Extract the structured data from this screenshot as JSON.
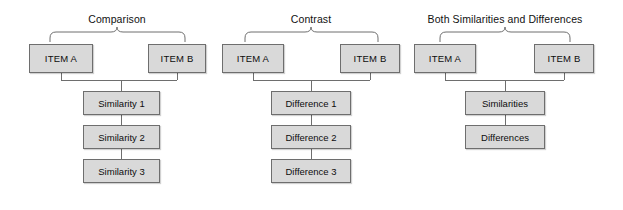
{
  "canvas": {
    "width": 623,
    "height": 210,
    "background": "#ffffff",
    "box_fill": "#d9d9d9",
    "box_border": "#6e6e6e",
    "line_color": "#6e6e6e",
    "text_color": "#111111"
  },
  "groups": [
    {
      "id": "comparison",
      "title": "Comparison",
      "title_x": 117,
      "title_y": 13,
      "brace": {
        "left": 50,
        "right": 185,
        "top": 27,
        "bottom": 42,
        "center": 117
      },
      "items": [
        {
          "label": "ITEM A",
          "x": 29,
          "y": 44,
          "w": 64,
          "h": 29
        },
        {
          "label": "ITEM B",
          "x": 148,
          "y": 44,
          "w": 58,
          "h": 29
        }
      ],
      "connector": {
        "left_x": 61,
        "right_x": 177,
        "from_y": 73,
        "bar_y": 80,
        "drop_x": 121,
        "to_y": 91
      },
      "details": [
        {
          "label": "Similarity 1",
          "x": 83,
          "y": 91,
          "w": 77,
          "h": 24
        },
        {
          "label": "Similarity 2",
          "x": 83,
          "y": 125,
          "w": 77,
          "h": 24
        },
        {
          "label": "Similarity 3",
          "x": 83,
          "y": 159,
          "w": 77,
          "h": 24
        }
      ],
      "detail_links": [
        {
          "x": 121,
          "y1": 115,
          "y2": 125
        },
        {
          "x": 121,
          "y1": 149,
          "y2": 159
        }
      ]
    },
    {
      "id": "contrast",
      "title": "Contrast",
      "title_x": 311,
      "title_y": 13,
      "brace": {
        "left": 245,
        "right": 378,
        "top": 27,
        "bottom": 42,
        "center": 311
      },
      "items": [
        {
          "label": "ITEM A",
          "x": 222,
          "y": 44,
          "w": 62,
          "h": 29
        },
        {
          "label": "ITEM B",
          "x": 340,
          "y": 44,
          "w": 60,
          "h": 29
        }
      ],
      "connector": {
        "left_x": 253,
        "right_x": 370,
        "from_y": 73,
        "bar_y": 80,
        "drop_x": 311,
        "to_y": 91
      },
      "details": [
        {
          "label": "Difference 1",
          "x": 271,
          "y": 91,
          "w": 80,
          "h": 24
        },
        {
          "label": "Difference 2",
          "x": 271,
          "y": 125,
          "w": 80,
          "h": 24
        },
        {
          "label": "Difference 3",
          "x": 271,
          "y": 159,
          "w": 80,
          "h": 24
        }
      ],
      "detail_links": [
        {
          "x": 311,
          "y1": 115,
          "y2": 125
        },
        {
          "x": 311,
          "y1": 149,
          "y2": 159
        }
      ]
    },
    {
      "id": "both-similarities-and-differences",
      "title": "Both Similarities and Differences",
      "title_x": 505,
      "title_y": 13,
      "brace": {
        "left": 440,
        "right": 570,
        "top": 27,
        "bottom": 42,
        "center": 505
      },
      "items": [
        {
          "label": "ITEM A",
          "x": 414,
          "y": 44,
          "w": 62,
          "h": 29
        },
        {
          "label": "ITEM B",
          "x": 534,
          "y": 44,
          "w": 60,
          "h": 29
        }
      ],
      "connector": {
        "left_x": 445,
        "right_x": 564,
        "from_y": 73,
        "bar_y": 80,
        "drop_x": 505,
        "to_y": 91
      },
      "details": [
        {
          "label": "Similarities",
          "x": 465,
          "y": 91,
          "w": 80,
          "h": 24
        },
        {
          "label": "Differences",
          "x": 465,
          "y": 125,
          "w": 80,
          "h": 24
        }
      ],
      "detail_links": [
        {
          "x": 505,
          "y1": 115,
          "y2": 125
        }
      ]
    }
  ]
}
